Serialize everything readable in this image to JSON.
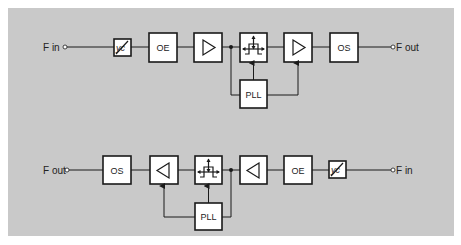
{
  "diagram": {
    "background_color": "#c9c9c9",
    "box_fill": "#ffffff",
    "line_color": "#1a1a1a",
    "top_chain": {
      "input_label": "F in",
      "output_label": "F out",
      "blocks": [
        {
          "id": "yc",
          "label": "yc",
          "icon": "phase-shifter-icon"
        },
        {
          "id": "oe",
          "label": "OE"
        },
        {
          "id": "amp1",
          "label": "",
          "icon": "amplifier-right-icon"
        },
        {
          "id": "filter",
          "label": "",
          "icon": "tunable-filter-icon"
        },
        {
          "id": "amp2",
          "label": "",
          "icon": "amplifier-right-icon"
        },
        {
          "id": "os",
          "label": "OS"
        }
      ],
      "pll_label": "PLL"
    },
    "bottom_chain": {
      "input_label": "F in",
      "output_label": "F out",
      "blocks": [
        {
          "id": "os",
          "label": "OS"
        },
        {
          "id": "amp2",
          "label": "",
          "icon": "amplifier-left-icon"
        },
        {
          "id": "filter",
          "label": "",
          "icon": "tunable-filter-icon"
        },
        {
          "id": "amp1",
          "label": "",
          "icon": "amplifier-left-icon"
        },
        {
          "id": "oe",
          "label": "OE"
        },
        {
          "id": "yc",
          "label": "yc",
          "icon": "phase-shifter-icon"
        }
      ],
      "pll_label": "PLL"
    }
  }
}
